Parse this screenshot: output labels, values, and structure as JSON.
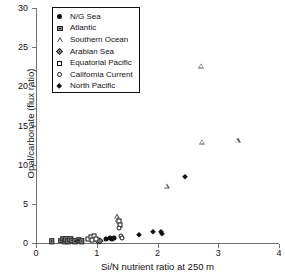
{
  "chart_data": {
    "type": "scatter",
    "title": "",
    "xlabel": "Si/N nutrient ratio at 250 m",
    "ylabel": "Opal/carbonate (flux ratio)",
    "xlim": [
      0,
      4
    ],
    "ylim": [
      0,
      30
    ],
    "xticks": [
      0,
      1,
      2,
      3,
      4
    ],
    "yticks": [
      0,
      5,
      10,
      15,
      20,
      25,
      30
    ],
    "grid": false,
    "legend_position": "top-left",
    "series": [
      {
        "name": "N/G Sea",
        "marker": "circle-filled",
        "points": [
          {
            "x": 1.16,
            "y": 0.55
          },
          {
            "x": 1.21,
            "y": 0.6
          },
          {
            "x": 1.25,
            "y": 0.5
          },
          {
            "x": 1.28,
            "y": 0.62
          }
        ]
      },
      {
        "name": "Atlantic",
        "marker": "square-dot",
        "points": [
          {
            "x": 0.26,
            "y": 0.25
          },
          {
            "x": 0.41,
            "y": 0.3
          },
          {
            "x": 0.45,
            "y": 0.55
          },
          {
            "x": 0.47,
            "y": 0.2
          },
          {
            "x": 0.5,
            "y": 0.45
          },
          {
            "x": 0.53,
            "y": 0.25
          },
          {
            "x": 0.56,
            "y": 0.5
          },
          {
            "x": 0.6,
            "y": 0.3
          },
          {
            "x": 0.65,
            "y": 0.2
          },
          {
            "x": 0.7,
            "y": 0.35
          },
          {
            "x": 0.75,
            "y": 0.25
          }
        ]
      },
      {
        "name": "Southern Ocean",
        "marker": "triangle-open",
        "points": [
          {
            "x": 1.33,
            "y": 3.4
          },
          {
            "x": 1.35,
            "y": 3.05
          },
          {
            "x": 2.15,
            "y": 7.3
          },
          {
            "x": 2.72,
            "y": 22.6
          },
          {
            "x": 2.73,
            "y": 12.9
          },
          {
            "x": 3.32,
            "y": 13.1
          }
        ]
      },
      {
        "name": "Arabian Sea",
        "marker": "diamond-dot",
        "points": [
          {
            "x": 1.02,
            "y": 0.3
          },
          {
            "x": 1.06,
            "y": 0.2
          }
        ]
      },
      {
        "name": "Equatorial Pacific",
        "marker": "square-open",
        "points": [
          {
            "x": 0.86,
            "y": 0.55
          },
          {
            "x": 0.9,
            "y": 0.75
          },
          {
            "x": 0.93,
            "y": 0.4
          },
          {
            "x": 0.96,
            "y": 0.85
          },
          {
            "x": 0.99,
            "y": 0.5
          },
          {
            "x": 1.37,
            "y": 2.75
          },
          {
            "x": 1.39,
            "y": 2.3
          }
        ]
      },
      {
        "name": "California Current",
        "marker": "circle-open",
        "points": [
          {
            "x": 1.36,
            "y": 1.95
          },
          {
            "x": 1.4,
            "y": 0.9
          },
          {
            "x": 1.42,
            "y": 0.65
          }
        ]
      },
      {
        "name": "North Pacific",
        "marker": "diamond-filled",
        "points": [
          {
            "x": 1.7,
            "y": 1.05
          },
          {
            "x": 1.92,
            "y": 1.45
          },
          {
            "x": 2.05,
            "y": 1.4
          },
          {
            "x": 2.08,
            "y": 1.2
          },
          {
            "x": 2.45,
            "y": 8.45
          }
        ]
      }
    ]
  }
}
